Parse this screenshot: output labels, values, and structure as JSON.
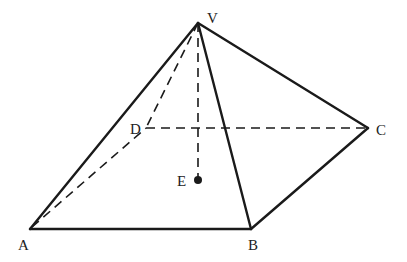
{
  "diagram": {
    "type": "square-pyramid",
    "points": {
      "V": {
        "label": "V",
        "x": 198,
        "y": 23
      },
      "A": {
        "label": "A",
        "x": 30,
        "y": 229
      },
      "B": {
        "label": "B",
        "x": 251,
        "y": 229
      },
      "C": {
        "label": "C",
        "x": 368,
        "y": 128
      },
      "D": {
        "label": "D",
        "x": 146,
        "y": 128
      },
      "E": {
        "label": "E",
        "x": 198,
        "y": 180
      }
    },
    "solid_edges": [
      "VA",
      "VB",
      "VC",
      "AB",
      "BC"
    ],
    "hidden_edges": [
      "VD",
      "AD",
      "DC",
      "VE"
    ],
    "colors": {
      "line": "#1a1a1a",
      "label": "#222222",
      "background": "#ffffff"
    }
  }
}
